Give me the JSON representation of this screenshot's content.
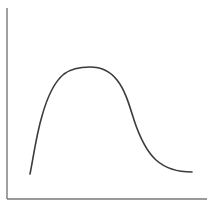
{
  "figure": {
    "kind": "line-chart",
    "background_color": "#ffffff",
    "width": 214,
    "height": 212,
    "title": "",
    "caption": ""
  },
  "axes": {
    "y_axis": {
      "name": "y-axis",
      "color": "#777777",
      "stroke_width": 1.4,
      "x": 7,
      "y_top": 8,
      "y_bottom": 199,
      "label": "",
      "ticks": []
    },
    "x_axis": {
      "name": "x-axis",
      "color": "#777777",
      "stroke_width": 1.4,
      "y": 199,
      "x_left": 7,
      "x_right": 207,
      "label": "",
      "ticks": []
    }
  },
  "curve": {
    "name": "main-curve",
    "color": "#3b3b3b",
    "stroke_width": 1.6,
    "path": "M 30 174 C 33 160 36 136 42 116 C 47 98 54 82 64 74 C 72 68 80 67 90 67 C 101 67 110 71 117 80 C 125 90 129 104 134 120 C 139 135 145 150 156 160 C 166 169 180 172 192 172"
  },
  "chart_data": {
    "type": "line",
    "title": "",
    "subtitle": "",
    "xlabel": "",
    "ylabel": "",
    "xlim": [
      0,
      100
    ],
    "ylim": [
      0,
      100
    ],
    "grid": false,
    "legend": false,
    "legend_position": "none",
    "axis_ticks_shown": false,
    "series": [
      {
        "name": "curve",
        "x": [
          12,
          15,
          18,
          21,
          25,
          29,
          33,
          37,
          41,
          45,
          49,
          53,
          57,
          61,
          65,
          69,
          73,
          77,
          81,
          85,
          89,
          93
        ],
        "y": [
          13,
          22,
          33,
          46,
          57,
          65,
          69,
          70,
          70,
          69,
          67,
          62,
          55,
          47,
          40,
          33,
          27,
          22,
          19,
          16,
          15,
          14
        ]
      }
    ],
    "annotations": [],
    "shape_description": "Asymmetric unimodal curve: steep rise on the left, broad flat plateau near the peak, long gradual decay to the right"
  }
}
